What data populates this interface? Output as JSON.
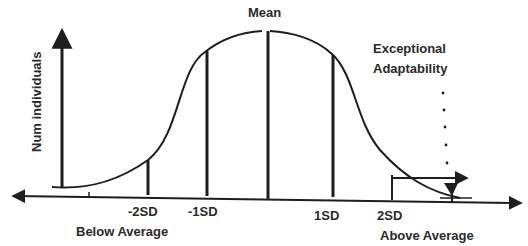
{
  "diagram": {
    "type": "normal-distribution-bell-curve",
    "y_axis_label": "Num individuals",
    "mean_label": "Mean",
    "tick_labels": {
      "minus_2sd": "-2SD",
      "minus_1sd": "-1SD",
      "plus_1sd": "1SD",
      "plus_2sd": "2SD"
    },
    "region_labels": {
      "below": "Below Average",
      "above": "Above Average"
    },
    "annotation": {
      "line1": "Exceptional",
      "line2": "Adaptability"
    },
    "colors": {
      "stroke": "#1e1e1e",
      "text": "#2a2a2a",
      "background": "#ffffff"
    }
  }
}
